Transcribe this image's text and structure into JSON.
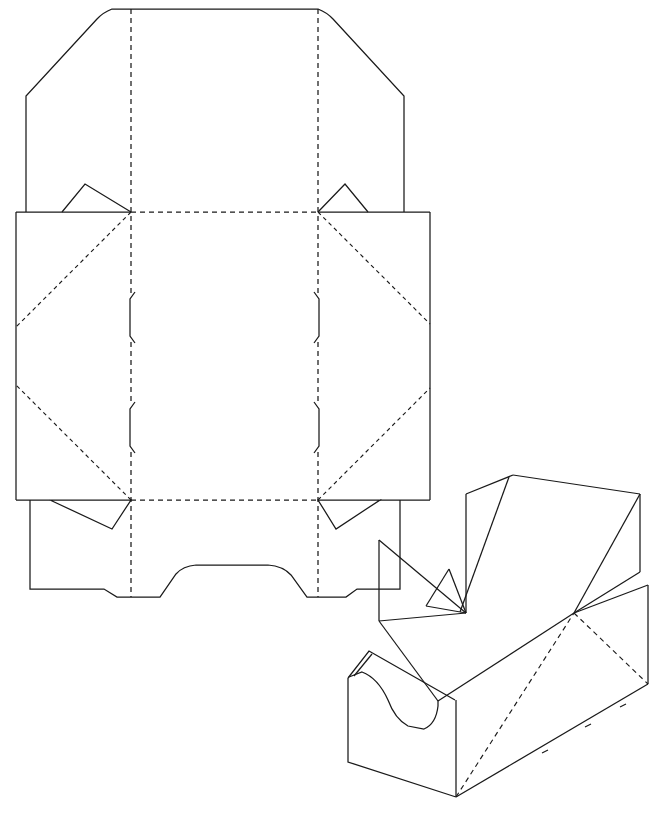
{
  "document": {
    "kind": "packaging-dieline-drawing",
    "title": "Counter display carton — flat dieline and assembled isometric view",
    "background_color": "#ffffff",
    "line_color": "#1a1a1a",
    "width": 659,
    "height": 815
  },
  "legend": {
    "cut_line_style": "solid",
    "crease_line_style": "dashed",
    "hidden_edge_style": "dashed"
  },
  "flat_pattern": {
    "name": "flat-dieline",
    "bounds": {
      "x": 16,
      "y": 8,
      "width": 414,
      "height": 600
    },
    "creases": {
      "vertical_left_x": 131,
      "vertical_right_x": 318,
      "horizontal_top_y": 212,
      "horizontal_bottom_y": 500
    },
    "panels": [
      {
        "id": "back-panel",
        "label": "back panel",
        "x": 26,
        "y": 8,
        "width": 292,
        "height": 204
      },
      {
        "id": "base-panel",
        "label": "base panel",
        "x": 131,
        "y": 212,
        "width": 187,
        "height": 288
      },
      {
        "id": "left-side-panel",
        "label": "left side panel",
        "x": 16,
        "y": 212,
        "width": 115,
        "height": 288
      },
      {
        "id": "right-side-panel",
        "label": "right side panel",
        "x": 318,
        "y": 212,
        "width": 112,
        "height": 288
      },
      {
        "id": "front-panel",
        "label": "front panel with scoop",
        "x": 30,
        "y": 500,
        "width": 370,
        "height": 108
      }
    ],
    "back_panel_outline": "M 26,212 L 26,96 L 100,16 L 112,8 L 318,8 L 331,16 L 404,96 L 404,212",
    "back_panel_corner_radius": 9,
    "left_panel_outline": "M 16,212 L 16,500 L 131,500",
    "right_panel_outline": "M 430,212 L 430,500 L 318,500",
    "left_panel_top_edge": "M 16,212 L 131,212",
    "right_panel_top_edge": "M 318,212 L 430,212",
    "front_panel_outline": "M 30,500 L 30,590 L 105,590 L 118,598 L 159,598 L 177,572 L 210,566 L 265,566 L 290,572 L 308,598 L 345,598 L 356,590 L 400,590 L 400,500",
    "front_scoop_radius": 13,
    "corner_tabs": [
      {
        "id": "tab-top-left",
        "type": "peak-tab",
        "points": "26,212 62,212 85,184 131,212"
      },
      {
        "id": "tab-top-right",
        "type": "peak-tab",
        "points": "404,212 368,212 345,184 318,212"
      },
      {
        "id": "tab-bottom-left",
        "type": "v-notch",
        "points": "131,500 50,500 95,500 112,528 131,500"
      },
      {
        "id": "tab-bottom-right",
        "type": "v-notch",
        "points": "318,500 380,500 336,528 318,500"
      }
    ],
    "corner_tab_paths": [
      "M 26,212 L 62,212 L 85,184 L 131,212",
      "M 404,212 L 368,212 L 345,184 L 318,212",
      "M 50,500 L 131,500 L 112,529 L 50,500",
      "M 380,500 L 318,500 L 336,529 L 380,500"
    ],
    "diagonal_creases": [
      "M 131,212 L 16,326",
      "M 131,500 L 16,386",
      "M 318,212 L 430,326",
      "M 318,500 L 430,386"
    ],
    "lock_tabs": [
      {
        "id": "lock-tab-left-upper",
        "path": "M 133,294 L 129,300 L 129,336 L 133,342"
      },
      {
        "id": "lock-tab-left-lower",
        "path": "M 133,404 L 129,410 L 129,446 L 133,452"
      },
      {
        "id": "lock-tab-right-upper",
        "path": "M 316,294 L 320,300 L 320,336 L 316,342"
      },
      {
        "id": "lock-tab-right-lower",
        "path": "M 316,404 L 320,410 L 320,446 L 316,452"
      }
    ]
  },
  "isometric_view": {
    "name": "assembled-display-box",
    "bounds": {
      "x": 340,
      "y": 470,
      "width": 319,
      "height": 330
    },
    "description": "Assembled open-fronted counter display tray with high sloping back panel and angled side wings",
    "edges": {
      "outer_body": "M 348,678 L 348,762 L 455,797 L 648,684 L 648,585",
      "base_front_left": "M 348,678 L 370,651",
      "front_top_rim": "M 370,651 L 455,700",
      "front_panel_face": "M 455,700 L 455,797",
      "front_scoop": "M 348,678 L 360,672 L 378,681 L 388,700 L 393,716 L 404,727 L 424,727 L 436,714 L 436,700",
      "back_panel": "M 466,613 L 510,480 L 513,474 L 640,494 L 640,572",
      "back_panel_left_edge": "M 466,613 L 466,493",
      "back_top_edge": "M 466,493 L 513,474",
      "back_right_edge": "M 640,494 L 640,572",
      "back_inner_fold": "M 513,474 L 640,494",
      "side_wing_left": "M 466,613 L 513,474",
      "side_wing_right": "M 640,494 L 575,612",
      "right_wing_lower": "M 575,612 L 648,585",
      "divider_left": "M 378,620 L 378,540",
      "divider_left_top": "M 378,540 L 465,613",
      "inner_liner_top": "M 425,604 L 466,613",
      "inner_liner_fold": "M 425,604 L 448,569"
    },
    "hidden_edges": [
      "M 575,612 L 648,684",
      "M 455,797 L 575,612",
      "M 575,612 L 640,655"
    ]
  }
}
